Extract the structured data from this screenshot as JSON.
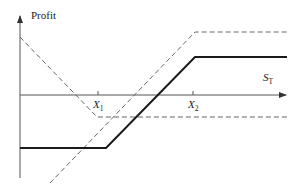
{
  "diagram": {
    "type": "option-payoff-diagram",
    "y_axis_label": "Profit",
    "x_axis_label": {
      "base": "S",
      "subscript": "T"
    },
    "strike_labels": [
      {
        "base": "X",
        "subscript": "1"
      },
      {
        "base": "X",
        "subscript": "2"
      }
    ],
    "colors": {
      "axis": "#555555",
      "solid_line": "#1a1a1a",
      "dashed_line": "#666666"
    },
    "lines": [
      {
        "name": "total-profit",
        "style": "solid",
        "description": "Flat loss below X1, rising between X1 and X2, flat gain above X2"
      },
      {
        "name": "put-component",
        "style": "dashed",
        "description": "Declining to X1, flat beyond"
      },
      {
        "name": "call-component",
        "style": "dashed",
        "description": "Rising to X2, flat beyond"
      }
    ]
  }
}
